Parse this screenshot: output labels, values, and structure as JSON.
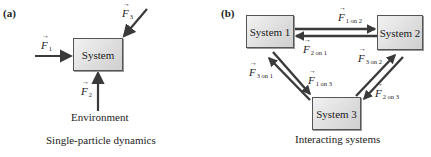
{
  "panel_a": {
    "label": "(a)",
    "system_label": "System",
    "environment_label": "Environment",
    "caption": "Single-particle dynamics",
    "forces": [
      {
        "symbol": "F",
        "subscript": "1"
      },
      {
        "symbol": "F",
        "subscript": "2"
      },
      {
        "symbol": "F",
        "subscript": "3"
      }
    ]
  },
  "panel_b": {
    "label": "(b)",
    "systems": [
      "System 1",
      "System 2",
      "System 3"
    ],
    "caption": "Interacting systems",
    "forces": [
      {
        "symbol": "F",
        "subscript": "1 on 2"
      },
      {
        "symbol": "F",
        "subscript": "2 on 1"
      },
      {
        "symbol": "F",
        "subscript": "3 on 1"
      },
      {
        "symbol": "F",
        "subscript": "1 on 3"
      },
      {
        "symbol": "F",
        "subscript": "3 on 2"
      },
      {
        "symbol": "F",
        "subscript": "2 on 3"
      }
    ]
  },
  "colors": {
    "arrow": "#3a3a3a",
    "box_border": "#555555",
    "box_fill": "#dcdcdc"
  }
}
